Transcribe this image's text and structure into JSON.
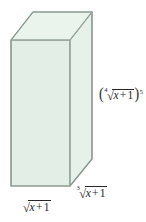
{
  "figure": {
    "kind": "rectangular-prism-diagram",
    "background_color": "#ffffff",
    "solid": {
      "name": "rectangular prism",
      "front_face_color": "#e2eee6",
      "side_face_color": "#e6f1e9",
      "top_face_color": "#eaf3ec",
      "edge_color": "#8a9a90"
    },
    "labels": {
      "width": {
        "role": "width",
        "position": "bottom-left",
        "radical_index": "",
        "radical_sign": "√",
        "radicand_var": "x",
        "radicand_op": "+",
        "radicand_num": "1",
        "exponent": ""
      },
      "depth": {
        "role": "depth",
        "position": "bottom-right",
        "radical_index": "3",
        "radical_sign": "√",
        "radicand_var": "x",
        "radicand_op": "+",
        "radicand_num": "1",
        "exponent": ""
      },
      "height": {
        "role": "height",
        "position": "right-side",
        "open_paren": "(",
        "close_paren": ")",
        "radical_index": "4",
        "radical_sign": "√",
        "radicand_var": "x",
        "radicand_op": "+",
        "radicand_num": "1",
        "exponent": "5"
      }
    }
  }
}
